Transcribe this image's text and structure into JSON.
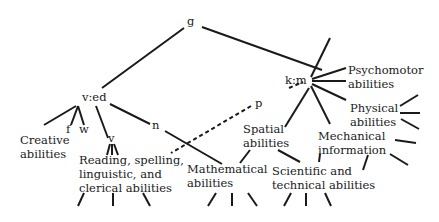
{
  "diagram": {
    "title": "",
    "nodes": {
      "g": "g",
      "ved": "v:ed",
      "km": "k:m",
      "f": "f",
      "w": "w",
      "v": "v",
      "n": "n",
      "p": "p",
      "creative": "Creative\nabilities",
      "reading": "Reading, spelling,\nlinguistic, and\nclerical abilities",
      "mathematical": "Mathematical\nabilities",
      "spatial": "Spatial\nabilities",
      "mechanical": "Mechanical\ninformation",
      "scientific": "Scientific and\ntechnical abilities",
      "psychomotor": "Psychomotor\nabilities",
      "physical": "Physical\nabilities"
    },
    "edges": [
      {
        "from": "g",
        "to": "v:ed",
        "style": "solid"
      },
      {
        "from": "g",
        "to": "k:m",
        "style": "solid"
      },
      {
        "from": "v:ed",
        "to": "Creative abilities",
        "style": "solid"
      },
      {
        "from": "v:ed",
        "to": "f",
        "style": "solid"
      },
      {
        "from": "v:ed",
        "to": "w",
        "style": "solid"
      },
      {
        "from": "v:ed",
        "to": "v",
        "style": "solid"
      },
      {
        "from": "v:ed",
        "to": "n",
        "style": "solid"
      },
      {
        "from": "v",
        "to": "Reading, spelling, linguistic, and clerical abilities",
        "style": "solid"
      },
      {
        "from": "n",
        "to": "Mathematical abilities",
        "style": "solid"
      },
      {
        "from": "k:m",
        "to": "p",
        "style": "dashed"
      },
      {
        "from": "p",
        "to": "Reading, spelling, linguistic, and clerical abilities",
        "style": "dashed"
      },
      {
        "from": "k:m",
        "to": "Spatial abilities",
        "style": "solid"
      },
      {
        "from": "k:m",
        "to": "Mechanical information",
        "style": "solid"
      },
      {
        "from": "k:m",
        "to": "Psychomotor abilities",
        "style": "solid"
      },
      {
        "from": "Spatial abilities",
        "to": "Mathematical abilities",
        "style": "solid"
      },
      {
        "from": "Spatial abilities",
        "to": "Scientific and technical abilities",
        "style": "solid"
      },
      {
        "from": "Mechanical information",
        "to": "Scientific and technical abilities",
        "style": "solid"
      }
    ]
  }
}
